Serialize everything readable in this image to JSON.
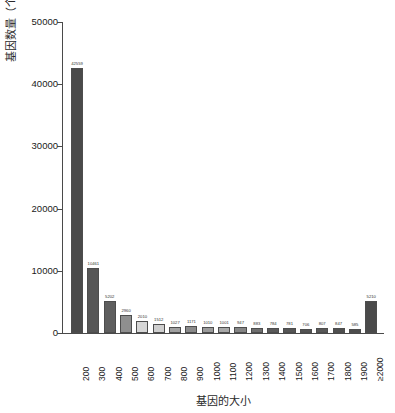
{
  "chart_data": {
    "type": "bar",
    "title": "",
    "subtitle": "",
    "xlabel": "基因的大小",
    "ylabel": "基因数量（个）",
    "ylim": [
      0,
      50000
    ],
    "ytick_values": [
      0,
      10000,
      20000,
      30000,
      40000,
      50000
    ],
    "ytick_labels": [
      "0",
      "10000",
      "20000",
      "30000",
      "40000",
      "50000"
    ],
    "grid": false,
    "legend": "none",
    "categories": [
      "200",
      "300",
      "400",
      "500",
      "600",
      "700",
      "800",
      "900",
      "1000",
      "1100",
      "1200",
      "1300",
      "1400",
      "1500",
      "1600",
      "1700",
      "1800",
      "1900",
      "≥2000"
    ],
    "values": [
      42559,
      10461,
      5202,
      2960,
      2010,
      1512,
      1027,
      1171,
      1010,
      1001,
      947,
      883,
      784,
      781,
      706,
      807,
      847,
      585,
      5210
    ],
    "value_labels": [
      "42559",
      "10461",
      "5202",
      "2960",
      "2010",
      "1512",
      "1027",
      "1171",
      "1010",
      "1001",
      "947",
      "883",
      "784",
      "781",
      "706",
      "807",
      "847",
      "585",
      "5210"
    ],
    "bar_colors": [
      "#4a4a4a",
      "#565656",
      "#5e5e5e",
      "#8f8f8f",
      "#d6d6d6",
      "#cfcfcf",
      "#a0a0a0",
      "#8a8a8a",
      "#9b9b9b",
      "#a8a8a8",
      "#858585",
      "#6f6f6f",
      "#5a5a5a",
      "#555555",
      "#525252",
      "#585858",
      "#4f4f4f",
      "#4c4c4c",
      "#4a4a4a"
    ],
    "bar_edge_color": "#4d4d4d",
    "axis_color": "#4a4a4a",
    "text_color": "#1a1a1a",
    "background": "#ffffff"
  }
}
